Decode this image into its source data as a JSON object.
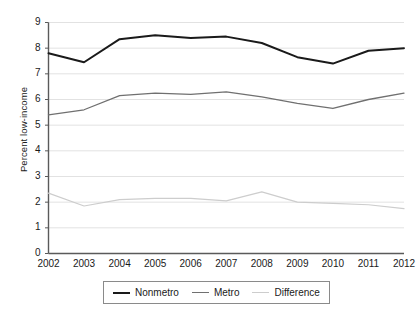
{
  "chart_data": {
    "type": "line",
    "title": "",
    "subtitle": "",
    "xlabel": "",
    "ylabel": "Percent low-income",
    "x": [
      2002,
      2003,
      2004,
      2005,
      2006,
      2007,
      2008,
      2009,
      2010,
      2011,
      2012
    ],
    "xtick_labels": [
      "2002",
      "2003",
      "2004",
      "2005",
      "2006",
      "2007",
      "2008",
      "2009",
      "2010",
      "2011",
      "2012"
    ],
    "ytick_labels": [
      "0",
      "1",
      "2",
      "3",
      "4",
      "5",
      "6",
      "7",
      "8",
      "9"
    ],
    "yticks": [
      0,
      1,
      2,
      3,
      4,
      5,
      6,
      7,
      8,
      9
    ],
    "ylim": [
      0,
      9
    ],
    "xlim": [
      2002,
      2012
    ],
    "grid": "horizontal",
    "legend_position": "bottom-center",
    "series": [
      {
        "name": "Nonmetro",
        "color": "#1a1a1a",
        "width": 2.0,
        "values": [
          7.8,
          7.45,
          8.35,
          8.5,
          8.4,
          8.45,
          8.2,
          7.65,
          7.4,
          7.9,
          8.0
        ]
      },
      {
        "name": "Metro",
        "color": "#707070",
        "width": 1.3,
        "values": [
          5.4,
          5.6,
          6.15,
          6.25,
          6.2,
          6.3,
          6.1,
          5.85,
          5.65,
          6.0,
          6.25
        ]
      },
      {
        "name": "Difference",
        "color": "#cdcdcd",
        "width": 1.2,
        "values": [
          2.35,
          1.85,
          2.1,
          2.15,
          2.15,
          2.05,
          2.4,
          2.0,
          1.95,
          1.9,
          1.75
        ]
      }
    ]
  },
  "legend": {
    "items": [
      {
        "label": "Nonmetro"
      },
      {
        "label": "Metro"
      },
      {
        "label": "Difference"
      }
    ]
  },
  "axis": {
    "y_title": "Percent low-income"
  }
}
